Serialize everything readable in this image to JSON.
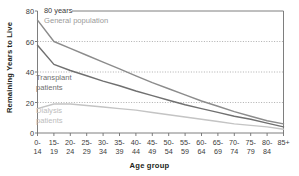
{
  "chart_data": {
    "type": "line",
    "title": "",
    "xlabel": "Age group",
    "ylabel": "Remaining Years to Live",
    "unit_note": "80 years",
    "ylim": [
      0,
      80
    ],
    "yticks": [
      80,
      60,
      40,
      20,
      0
    ],
    "grid": "horizontal dotted at 60, 40, 20",
    "legend_position": "inline labels on plot",
    "categories": [
      "0-14",
      "15-19",
      "20-24",
      "25-29",
      "30-34",
      "35-39",
      "40-44",
      "45-49",
      "50-54",
      "55-59",
      "60-64",
      "65-69",
      "70-74",
      "75-79",
      "80-84",
      "85+"
    ],
    "category_lines": [
      [
        "0-",
        "14"
      ],
      [
        "15-",
        "19"
      ],
      [
        "20-",
        "24"
      ],
      [
        "25-",
        "29"
      ],
      [
        "30-",
        "34"
      ],
      [
        "35-",
        "39"
      ],
      [
        "40-",
        "44"
      ],
      [
        "45-",
        "49"
      ],
      [
        "50-",
        "54"
      ],
      [
        "55-",
        "59"
      ],
      [
        "60-",
        "64"
      ],
      [
        "65-",
        "69"
      ],
      [
        "70-",
        "74"
      ],
      [
        "75-",
        "79"
      ],
      [
        "80-",
        "84"
      ],
      [
        "85+",
        ""
      ]
    ],
    "series": [
      {
        "name": "General population",
        "color": "#8c8c8c",
        "values": [
          74,
          60,
          55.5,
          51,
          46.5,
          42,
          37.5,
          33,
          29,
          25,
          21,
          17.5,
          14,
          11,
          8,
          6
        ]
      },
      {
        "name": "Transplant patients",
        "color": "#707070",
        "values": [
          57.5,
          45,
          41,
          37.5,
          34,
          31,
          27.5,
          24.5,
          21.5,
          18.5,
          16,
          13.5,
          11,
          9,
          6.5,
          4
        ]
      },
      {
        "name": "Dialysis patients",
        "color": "#c4c4c4",
        "values": [
          16,
          19,
          19,
          18,
          17,
          16,
          15,
          13.5,
          12,
          10.5,
          9,
          7.5,
          6,
          5,
          4,
          2.5
        ]
      }
    ]
  },
  "axis": {
    "y_ticks": [
      "80",
      "60",
      "40",
      "20",
      "0"
    ],
    "y_title": "Remaining Years to Live",
    "x_title": "Age group",
    "top_unit_label": "80 years"
  },
  "labels": {
    "general": "General population",
    "transplant_line1": "Transplant",
    "transplant_line2": "patients",
    "dialysis_line1": "Dialysis",
    "dialysis_line2": "patients"
  },
  "colors": {
    "general": "#8c8c8c",
    "transplant": "#707070",
    "dialysis": "#c4c4c4",
    "axis": "#6f6f6f",
    "grid": "#9a9a9a",
    "text": "#3b3b3b"
  }
}
